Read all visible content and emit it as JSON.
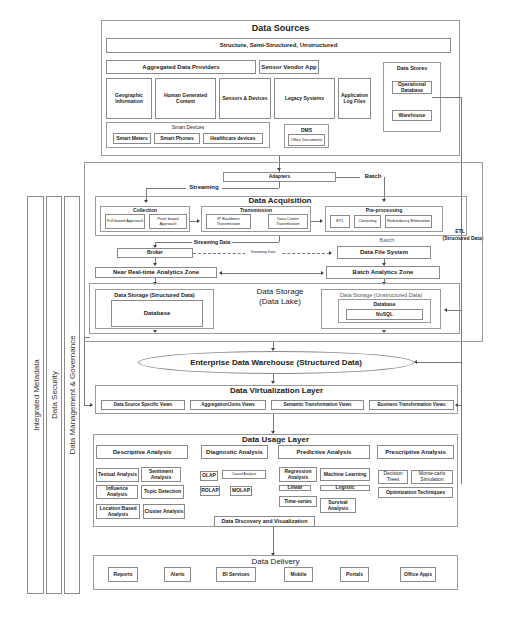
{
  "sources": {
    "title": "Data Sources",
    "types": "Structure, Semi-Structured, Unstructured",
    "aggregated": "Aggregated Data Providers",
    "sensor_vendor": "Sensor Vendor App",
    "geographic": "Geographic Information",
    "human": "Human Generated Content",
    "sensors": "Sensors & Devices",
    "legacy": "Legacy Systems",
    "applog": "Application Log Files",
    "smart_devices": {
      "title": "Smart Devices",
      "items": [
        "Smart Meters",
        "Smart Phones",
        "Healthcare devices"
      ]
    },
    "dms": {
      "title": "DMS",
      "item": "Office Documents"
    },
    "stores": {
      "title": "Data Stores",
      "operational": "Operational Database",
      "warehouse": "Warehouse"
    }
  },
  "flow": {
    "adapters": "Adapters",
    "streaming": "Streaming",
    "batch": "Batch",
    "streaming_data": "Streaming Data",
    "streaming_data_small": "Streaming Data",
    "batch2": "Batch",
    "etl": "ETL",
    "etl_sub": "(Structured Data)"
  },
  "acquisition": {
    "title": "Data Acquisition",
    "collection": {
      "title": "Collection",
      "items": [
        "Pull based Approach",
        "Push based Approach"
      ]
    },
    "transmission": {
      "title": "Transmission",
      "items": [
        "IP Backbone Transmission",
        "Data Centre Transmission"
      ]
    },
    "preprocessing": {
      "title": "Pre-processing",
      "items": [
        "ETL",
        "Cleansing",
        "Redundancy Elimination"
      ]
    }
  },
  "middle": {
    "broker": "Broker",
    "dfs": "Data File System",
    "nrt": "Near Real-time Analytics Zone",
    "batch_zone": "Batch Analytics Zone"
  },
  "storage": {
    "title": "Data Storage",
    "subtitle": "(Data Lake)",
    "structured": {
      "title": "Data Storage (Structured Data)",
      "db": "Database"
    },
    "unstructured": {
      "title": "Data Storage (Unstructured Data)",
      "db": "Database",
      "nosql": "NoSQL"
    }
  },
  "edw": "Enterprise Data Warehouse (Structured Data)",
  "virtualization": {
    "title": "Data Virtualization Layer",
    "views": [
      "Data Source Specific Views",
      "Aggregation/Joins Views",
      "Semantic Transformation Views",
      "Business Transformation Views"
    ]
  },
  "usage": {
    "title": "Data Usage Layer",
    "descriptive": {
      "title": "Descriptive Analysis",
      "items": [
        "Textual Analysis",
        "Sentiment Analysis",
        "Influence Analysis",
        "Topic Detection",
        "Location Based Analysis",
        "Cluster Analysis"
      ]
    },
    "diagnostic": {
      "title": "Diagnostic Analysis",
      "items": [
        "OLAP",
        "Causal Analysis",
        "ROLAP",
        "MOLAP"
      ]
    },
    "predictive": {
      "title": "Predictive Analysis",
      "items": [
        "Regression Analysis",
        "Machine Learning",
        "Linear",
        "Logistic",
        "Time-series",
        "Survival Analysis"
      ]
    },
    "prescriptive": {
      "title": "Prescriptive Analysis",
      "items": [
        "Decision Trees",
        "Monte-carlo Simulation",
        "Optimization Techniques"
      ]
    },
    "discovery": "Data Discovery and Visualization"
  },
  "delivery": {
    "title": "Data Delivery",
    "items": [
      "Reports",
      "Alerts",
      "BI Services",
      "Mobile",
      "Portals",
      "Office Apps"
    ]
  },
  "sidebars": [
    "Integrated Metadata",
    "Data Security",
    "Data  Management & Governance"
  ]
}
